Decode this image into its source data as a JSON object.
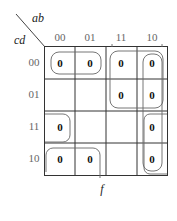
{
  "row_var": "cd",
  "col_var": "ab",
  "function_name": "f",
  "col_labels": [
    "00",
    "01",
    "11",
    "10"
  ],
  "row_labels": [
    "00",
    "01",
    "11",
    "10"
  ],
  "cells": [
    [
      "0",
      "0",
      "0",
      "0"
    ],
    [
      "",
      "",
      "0",
      "0"
    ],
    [
      "0",
      "",
      "",
      "0"
    ],
    [
      "0",
      "0",
      "",
      "0"
    ]
  ],
  "groups": [
    {
      "name": "row00-cols00-01",
      "cells": [
        [
          0,
          0
        ],
        [
          0,
          1
        ]
      ]
    },
    {
      "name": "rows00-01-cols11-10",
      "cells": [
        [
          0,
          2
        ],
        [
          0,
          3
        ],
        [
          1,
          2
        ],
        [
          1,
          3
        ]
      ]
    },
    {
      "name": "col10-all-rows",
      "cells": [
        [
          0,
          3
        ],
        [
          1,
          3
        ],
        [
          2,
          3
        ],
        [
          3,
          3
        ]
      ]
    },
    {
      "name": "corners-col00-rows11-10",
      "cells": [
        [
          2,
          0
        ],
        [
          3,
          0
        ]
      ]
    },
    {
      "name": "row10-cols00-01",
      "cells": [
        [
          3,
          0
        ],
        [
          3,
          1
        ]
      ]
    }
  ]
}
